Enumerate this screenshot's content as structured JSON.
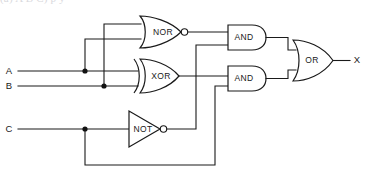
{
  "page": {
    "header_fragment": "(a)  A  B  C)                                                      p    y",
    "background_color": "#ffffff",
    "line_color": "#1a1a1a"
  },
  "diagram": {
    "inputs": [
      {
        "id": "A",
        "label": "A",
        "label_x": 8,
        "label_y": 71,
        "wire_y": 71
      },
      {
        "id": "B",
        "label": "B",
        "label_x": 8,
        "label_y": 86,
        "wire_y": 86
      },
      {
        "id": "C",
        "label": "C",
        "label_x": 8,
        "label_y": 129,
        "wire_y": 129
      }
    ],
    "outputs": [
      {
        "id": "X",
        "label": "X",
        "label_x": 356,
        "label_y": 61
      }
    ],
    "gates": [
      {
        "id": "nor1",
        "type": "NOR",
        "label": "NOR",
        "label_x": 163,
        "label_y": 32,
        "inputs": [
          "B",
          "A"
        ],
        "output_to": [
          "and1.in1"
        ]
      },
      {
        "id": "xor1",
        "type": "XOR",
        "label": "XOR",
        "label_x": 160,
        "label_y": 76,
        "inputs": [
          "A",
          "B"
        ],
        "output_to": [
          "and2.in1"
        ]
      },
      {
        "id": "not1",
        "type": "NOT",
        "label": "NOT",
        "label_x": 142,
        "label_y": 129,
        "inputs": [
          "C"
        ],
        "output_to": [
          "and1.in2"
        ]
      },
      {
        "id": "and1",
        "type": "AND",
        "label": "AND",
        "label_x": 244,
        "label_y": 37,
        "inputs": [
          "nor1",
          "not1"
        ],
        "output_to": [
          "or1.in1"
        ]
      },
      {
        "id": "and2",
        "type": "AND",
        "label": "AND",
        "label_x": 244,
        "label_y": 79,
        "inputs": [
          "xor1",
          "C"
        ],
        "output_to": [
          "or1.in2"
        ]
      },
      {
        "id": "or1",
        "type": "OR",
        "label": "OR",
        "label_x": 311,
        "label_y": 61,
        "inputs": [
          "and1",
          "and2"
        ],
        "output_to": [
          "X"
        ]
      }
    ],
    "junctions": [
      {
        "on": "A",
        "x": 85,
        "y": 71,
        "branch": "up-to-nor-lower-input"
      },
      {
        "on": "B",
        "x": 104,
        "y": 86,
        "branch": "up-to-nor-upper-input"
      },
      {
        "on": "C",
        "x": 85,
        "y": 129,
        "branch": "down-to-and2-lower-input"
      }
    ],
    "expression": "X = (NOR(A,B) AND NOT C) OR (XOR(A,B) AND C)"
  }
}
